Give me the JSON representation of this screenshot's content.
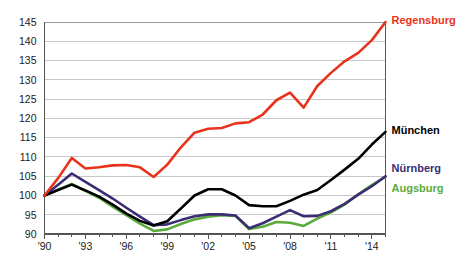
{
  "chart_data": {
    "type": "line",
    "title": "",
    "subtitle": "",
    "xlabel": "",
    "ylabel": "",
    "xlim": [
      1990,
      2015
    ],
    "ylim": [
      90,
      145
    ],
    "grid": true,
    "legend_position": "right-inline",
    "x_tick_labels": [
      "'90",
      "'93",
      "'96",
      "'99",
      "'02",
      "'05",
      "'08",
      "'11",
      "'14"
    ],
    "x_tick_values": [
      1990,
      1993,
      1996,
      1999,
      2002,
      2005,
      2008,
      2011,
      2014
    ],
    "y_tick_labels": [
      "90",
      "95",
      "100",
      "105",
      "110",
      "115",
      "120",
      "125",
      "130",
      "135",
      "140",
      "145"
    ],
    "y_tick_values": [
      90,
      95,
      100,
      105,
      110,
      115,
      120,
      125,
      130,
      135,
      140,
      145
    ],
    "x": [
      1990,
      1991,
      1992,
      1993,
      1994,
      1995,
      1996,
      1997,
      1998,
      1999,
      2000,
      2001,
      2002,
      2003,
      2004,
      2005,
      2006,
      2007,
      2008,
      2009,
      2010,
      2011,
      2012,
      2013,
      2014,
      2015
    ],
    "series": [
      {
        "name": "Regensburg",
        "color": "#e8331c",
        "label_color": "#e8331c",
        "values": [
          100.0,
          104.5,
          109.7,
          107.0,
          107.3,
          107.8,
          107.9,
          107.3,
          104.8,
          108.0,
          112.5,
          116.3,
          117.3,
          117.5,
          118.7,
          119.0,
          121.0,
          124.7,
          126.7,
          122.8,
          128.4,
          131.8,
          134.8,
          137.0,
          140.3,
          145.0
        ]
      },
      {
        "name": "München",
        "color": "#000000",
        "label_color": "#000000",
        "values": [
          100.0,
          101.4,
          102.8,
          101.3,
          99.7,
          97.6,
          95.3,
          93.4,
          92.2,
          93.3,
          96.6,
          100.0,
          101.6,
          101.6,
          100.0,
          97.5,
          97.2,
          97.2,
          98.6,
          100.2,
          101.4,
          104.0,
          106.7,
          109.5,
          113.2,
          116.5
        ]
      },
      {
        "name": "Nürnberg",
        "color": "#3b2d73",
        "label_color": "#3b2d73",
        "values": [
          100.0,
          102.8,
          105.7,
          103.5,
          101.4,
          99.2,
          96.8,
          94.5,
          92.3,
          92.5,
          93.6,
          94.6,
          95.1,
          95.1,
          94.8,
          91.5,
          92.8,
          94.5,
          96.2,
          94.6,
          94.7,
          95.9,
          97.8,
          100.2,
          102.4,
          105.0
        ]
      },
      {
        "name": "Augsburg",
        "color": "#5aaa3c",
        "label_color": "#5aaa3c",
        "values": [
          100.0,
          101.5,
          103.0,
          101.2,
          99.4,
          97.1,
          94.9,
          92.7,
          90.8,
          91.2,
          92.6,
          93.8,
          94.5,
          94.9,
          94.7,
          91.3,
          91.9,
          93.1,
          92.9,
          92.1,
          94.0,
          95.6,
          97.6,
          100.3,
          102.7,
          104.8
        ]
      }
    ],
    "annotations": [
      {
        "name": "Regensburg",
        "text": "Regensburg",
        "color": "#e8331c"
      },
      {
        "name": "München",
        "text": "München",
        "color": "#000000"
      },
      {
        "name": "Nürnberg",
        "text": "Nürnberg",
        "color": "#3b2d73"
      },
      {
        "name": "Augsburg",
        "text": "Augsburg",
        "color": "#5aaa3c"
      }
    ]
  },
  "labels": {
    "regensburg": "Regensburg",
    "muenchen": "München",
    "nuernberg": "Nürnberg",
    "augsburg": "Augsburg"
  },
  "colors": {
    "regensburg": "#e8331c",
    "muenchen": "#000000",
    "nuernberg": "#3b2d73",
    "augsburg": "#5aaa3c",
    "grid": "#c8c8c8",
    "axis": "#555555",
    "text": "#1a1a1a",
    "background": "#ffffff"
  }
}
